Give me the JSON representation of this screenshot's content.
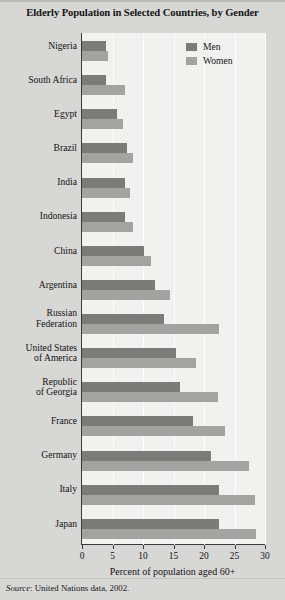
{
  "chart_data": {
    "type": "bar",
    "orientation": "horizontal",
    "title": "Elderly Population in Selected Countries, by Gender",
    "xlabel": "Percent of population aged 60+",
    "ylabel": "",
    "xlim": [
      0,
      30
    ],
    "xticks": [
      0,
      5,
      10,
      15,
      20,
      25,
      30
    ],
    "xtick_labels": [
      "0",
      "5",
      "10",
      "15",
      "20",
      "25",
      "30"
    ],
    "grid": true,
    "grid_axis": "x",
    "legend_position": "top-right",
    "categories": [
      "Nigeria",
      "South Africa",
      "Egypt",
      "Brazil",
      "India",
      "Indonesia",
      "China",
      "Argentina",
      "Russian\nFederation",
      "United States\nof America",
      "Republic\nof Georgia",
      "France",
      "Germany",
      "Italy",
      "Japan"
    ],
    "series": [
      {
        "name": "Men",
        "color": "#7b7b79",
        "values": [
          4.0,
          4.0,
          5.7,
          7.4,
          7.1,
          7.1,
          10.2,
          12.0,
          13.4,
          15.4,
          16.1,
          18.2,
          21.2,
          22.4,
          22.4
        ]
      },
      {
        "name": "Women",
        "color": "#a3a3a1",
        "values": [
          4.2,
          7.1,
          6.7,
          8.4,
          7.9,
          8.4,
          11.3,
          14.4,
          22.5,
          18.7,
          22.3,
          23.4,
          27.3,
          28.3,
          28.6
        ]
      }
    ],
    "source_prefix": "Source",
    "source_text": ": United Nations data, 2002."
  },
  "legend": {
    "items": [
      {
        "label": "Men",
        "color": "#7b7b79"
      },
      {
        "label": "Women",
        "color": "#a3a3a1"
      }
    ]
  },
  "colors": {
    "page_background": "#d7d7d5",
    "plot_background": "#f1f1ef",
    "gridline": "#fdfdfd",
    "axis": "#3a3a3a",
    "men": "#7b7b79",
    "women": "#a3a3a1",
    "text": "#141414"
  }
}
